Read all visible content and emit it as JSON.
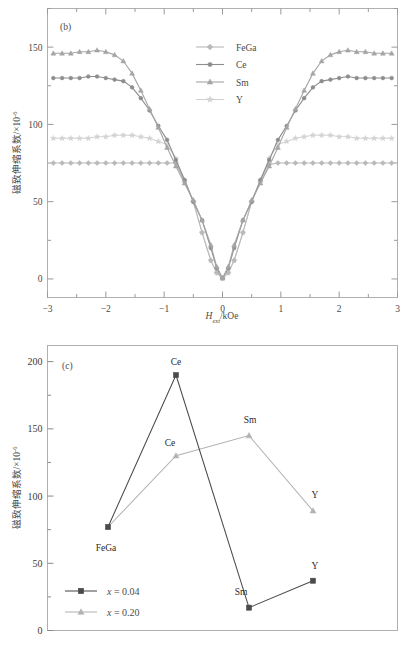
{
  "figure": {
    "panels": [
      "b",
      "c"
    ]
  },
  "panel_b": {
    "tag": "(b)",
    "xlabel_main": "H",
    "xlabel_sub": "ext",
    "xlabel_rest": "/kOe",
    "ylabel_main": "磁致伸缩系数/×10",
    "ylabel_sup": "-6",
    "xticks": [
      "-3",
      "-2",
      "-1",
      "0",
      "1",
      "2",
      "3"
    ],
    "yticks": [
      "0",
      "50",
      "100",
      "150"
    ],
    "legend": [
      {
        "label": "FeGa",
        "color": "#b9b9b9",
        "marker": "diamond"
      },
      {
        "label": "Ce",
        "color": "#8d8d8d",
        "marker": "circle"
      },
      {
        "label": "Sm",
        "color": "#a5a5a5",
        "marker": "triangle"
      },
      {
        "label": "Y",
        "color": "#d2d2d2",
        "marker": "star"
      }
    ]
  },
  "panel_c": {
    "tag": "(c)",
    "ylabel_main": "磁致伸缩系数/×10",
    "ylabel_sup": "-6",
    "yticks": [
      "0",
      "50",
      "100",
      "150",
      "200"
    ],
    "legend": [
      {
        "label": "x = 0.04",
        "color": "#4a4a4a",
        "marker": "square"
      },
      {
        "label": "x = 0.20",
        "color": "#b3b3b3",
        "marker": "triangle"
      }
    ]
  },
  "chart_data": [
    {
      "type": "line",
      "id": "panel-b",
      "title": "(b)",
      "xlabel": "H_ext/kOe",
      "ylabel": "磁致伸缩系数/×10^-6",
      "xlim": [
        -3,
        3
      ],
      "ylim": [
        -12,
        175
      ],
      "xticks": [
        -3,
        -2,
        -1,
        0,
        1,
        2,
        3
      ],
      "yticks": [
        0,
        50,
        100,
        150
      ],
      "grid": false,
      "legend_position": "top-center",
      "series": [
        {
          "name": "FeGa",
          "color": "#b9b9b9",
          "marker": "diamond",
          "x": [
            -2.9,
            -2.75,
            -2.6,
            -2.45,
            -2.3,
            -2.15,
            -2.0,
            -1.85,
            -1.7,
            -1.55,
            -1.4,
            -1.25,
            -1.1,
            -0.95,
            -0.8,
            -0.65,
            -0.5,
            -0.35,
            -0.2,
            -0.1,
            0,
            0.1,
            0.2,
            0.35,
            0.5,
            0.65,
            0.8,
            0.95,
            1.1,
            1.25,
            1.4,
            1.55,
            1.7,
            1.85,
            2.0,
            2.15,
            2.3,
            2.45,
            2.6,
            2.75,
            2.9
          ],
          "y": [
            75,
            75,
            75,
            75,
            75,
            75,
            75,
            75,
            75,
            75,
            75,
            75,
            75,
            75,
            75,
            63,
            50,
            30,
            12,
            4,
            0.5,
            4,
            12,
            30,
            50,
            63,
            74,
            75,
            75,
            75,
            75,
            75,
            75,
            75,
            75,
            75,
            75,
            75,
            75,
            75,
            75
          ]
        },
        {
          "name": "Ce",
          "color": "#8d8d8d",
          "marker": "circle",
          "x": [
            -2.9,
            -2.75,
            -2.6,
            -2.45,
            -2.3,
            -2.15,
            -2.0,
            -1.85,
            -1.7,
            -1.55,
            -1.4,
            -1.25,
            -1.1,
            -0.95,
            -0.8,
            -0.65,
            -0.5,
            -0.35,
            -0.2,
            -0.1,
            0,
            0.1,
            0.2,
            0.35,
            0.5,
            0.65,
            0.8,
            0.95,
            1.1,
            1.25,
            1.4,
            1.55,
            1.7,
            1.85,
            2.0,
            2.15,
            2.3,
            2.45,
            2.6,
            2.75,
            2.9
          ],
          "y": [
            130,
            130,
            130,
            130,
            131,
            131,
            130,
            129,
            128,
            124,
            117,
            109,
            99,
            90,
            77,
            64,
            50,
            38,
            20,
            7,
            0.5,
            7,
            20,
            38,
            50,
            64,
            77,
            90,
            99,
            109,
            117,
            124,
            128,
            129,
            130,
            131,
            130,
            130,
            130,
            130,
            130
          ]
        },
        {
          "name": "Sm",
          "color": "#a5a5a5",
          "marker": "triangle",
          "x": [
            -2.9,
            -2.75,
            -2.6,
            -2.45,
            -2.3,
            -2.15,
            -2.0,
            -1.85,
            -1.7,
            -1.55,
            -1.4,
            -1.25,
            -1.1,
            -0.95,
            -0.8,
            -0.65,
            -0.5,
            -0.35,
            -0.2,
            -0.1,
            0,
            0.1,
            0.2,
            0.35,
            0.5,
            0.65,
            0.8,
            0.95,
            1.1,
            1.25,
            1.4,
            1.55,
            1.7,
            1.85,
            2.0,
            2.15,
            2.3,
            2.45,
            2.6,
            2.75,
            2.9
          ],
          "y": [
            146,
            146,
            146,
            147,
            147,
            148,
            147,
            145,
            141,
            133,
            122,
            110,
            98,
            85,
            73,
            62,
            51,
            38,
            22,
            8,
            0.5,
            8,
            22,
            38,
            51,
            62,
            73,
            85,
            98,
            110,
            122,
            133,
            141,
            145,
            147,
            148,
            147,
            147,
            146,
            146,
            146
          ]
        },
        {
          "name": "Y",
          "color": "#d2d2d2",
          "marker": "star",
          "x": [
            -2.9,
            -2.75,
            -2.6,
            -2.45,
            -2.3,
            -2.15,
            -2.0,
            -1.85,
            -1.7,
            -1.55,
            -1.4,
            -1.25,
            -1.1,
            -0.95,
            -0.8,
            -0.65,
            -0.5,
            -0.35,
            -0.2,
            -0.1,
            0,
            0.1,
            0.2,
            0.35,
            0.5,
            0.65,
            0.8,
            0.95,
            1.1,
            1.25,
            1.4,
            1.55,
            1.7,
            1.85,
            2.0,
            2.15,
            2.3,
            2.45,
            2.6,
            2.75,
            2.9
          ],
          "y": [
            91,
            91,
            91,
            91,
            91,
            92,
            92,
            93,
            93,
            93,
            92,
            91,
            89,
            87,
            78,
            64,
            50,
            30,
            12,
            4,
            0.5,
            4,
            12,
            30,
            50,
            64,
            78,
            87,
            89,
            91,
            92,
            93,
            93,
            93,
            92,
            92,
            91,
            91,
            91,
            91,
            91
          ]
        }
      ]
    },
    {
      "type": "line",
      "id": "panel-c",
      "title": "(c)",
      "xlabel": "",
      "ylabel": "磁致伸缩系数/×10^-6",
      "categories": [
        "FeGa",
        "Ce",
        "Sm",
        "Y"
      ],
      "ylim": [
        0,
        212
      ],
      "yticks": [
        0,
        50,
        100,
        150,
        200
      ],
      "grid": false,
      "legend_position": "bottom-left",
      "series": [
        {
          "name": "x = 0.04",
          "color": "#4a4a4a",
          "marker": "square",
          "values": [
            77,
            190,
            17,
            37
          ],
          "point_labels": [
            "FeGa",
            "Ce",
            "Sm",
            "Y"
          ]
        },
        {
          "name": "x = 0.20",
          "color": "#b3b3b3",
          "marker": "triangle",
          "values": [
            77,
            130,
            145,
            89
          ],
          "point_labels": [
            "FeGa",
            "Ce",
            "Sm",
            "Y"
          ]
        }
      ]
    }
  ]
}
